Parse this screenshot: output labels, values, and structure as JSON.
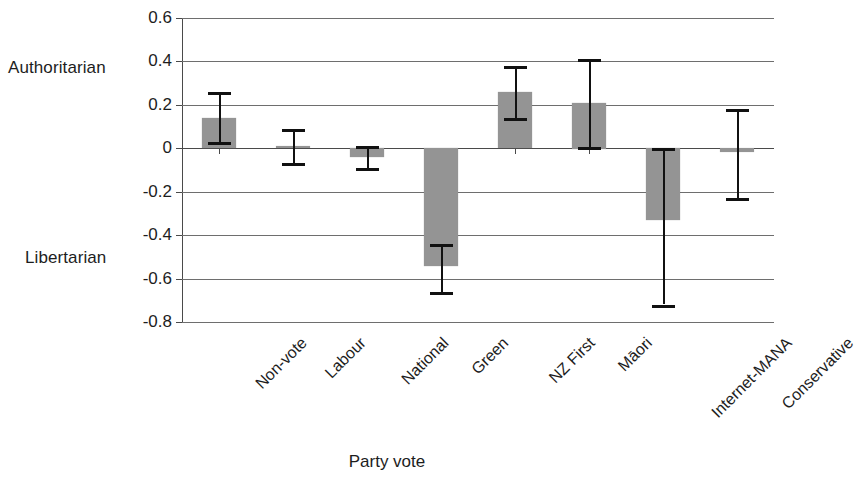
{
  "chart_data": {
    "type": "bar",
    "title": "",
    "subtitle": "",
    "xlabel": "Party vote",
    "ylabel": "",
    "ylim": [
      -0.8,
      0.6
    ],
    "ytick_values": [
      0.6,
      0.4,
      0.2,
      0,
      -0.2,
      -0.4,
      -0.6,
      -0.8
    ],
    "ytick_labels": [
      "0.6",
      "0.4",
      "0.2",
      "0",
      "-0.2",
      "-0.4",
      "-0.6",
      "-0.8"
    ],
    "grid": true,
    "legend": false,
    "legend_position": "none",
    "error_bars": true,
    "bar_color": "#949494",
    "error_bar_color": "#111111",
    "axis_color": "#4a4a4a",
    "gridline_color": "#6e6e6e",
    "categories": [
      "Non-vote",
      "Labour",
      "National",
      "Green",
      "NZ First",
      "Māori",
      "Internet-MANA",
      "Conservative"
    ],
    "values": [
      0.14,
      0.01,
      -0.04,
      -0.545,
      0.26,
      0.21,
      -0.33,
      -0.02
    ],
    "error_low": [
      0.03,
      -0.07,
      -0.09,
      -0.66,
      0.14,
      0.005,
      -0.72,
      -0.23
    ],
    "error_high": [
      0.26,
      0.09,
      0.01,
      -0.44,
      0.38,
      0.41,
      0.0,
      0.18
    ],
    "axis_anchor_labels": [
      {
        "text": "Authoritarian",
        "at_value": 0.4
      },
      {
        "text": "Libertarian",
        "at_value": -0.6
      }
    ],
    "annotations": []
  }
}
